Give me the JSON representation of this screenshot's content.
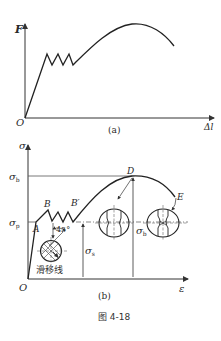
{
  "figure": {
    "caption": "图 4-18",
    "panel_a": {
      "label": "(a)",
      "y_axis": "F",
      "x_axis": "Δl",
      "origin": "O",
      "description": "Load–elongation curve of low-carbon steel in tension"
    },
    "panel_b": {
      "label": "(b)",
      "y_axis": "σ",
      "x_axis": "ε",
      "origin": "O",
      "levels": {
        "sigma_b": "σ",
        "sigma_b_sub": "b",
        "sigma_p": "σ",
        "sigma_p_sub": "p"
      },
      "points": {
        "A": "A",
        "B": "B",
        "B_prime": "B′",
        "D": "D",
        "E": "E"
      },
      "dimension_labels": {
        "sigma_s": "σ",
        "sigma_s_sub": "s",
        "sigma_b": "σ",
        "sigma_b_sub": "b"
      },
      "angle_label": "45°",
      "slip_lines_label": "滑移线"
    }
  }
}
